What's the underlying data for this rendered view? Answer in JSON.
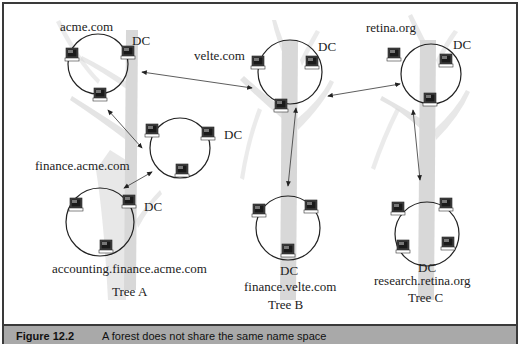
{
  "figure": {
    "caption_number": "Figure 12.2",
    "caption_text": "A forest does not share the same name space"
  },
  "colors": {
    "tree_trunk": "#d4d4d4",
    "frame_border": "#3a3a3a",
    "caption_band": "#a9a9a9",
    "circle_stroke": "#222222",
    "arrow": "#333333"
  },
  "trees": [
    {
      "id": "A",
      "label": "Tree A"
    },
    {
      "id": "B",
      "label": "Tree B"
    },
    {
      "id": "C",
      "label": "Tree C"
    }
  ],
  "domains": [
    {
      "name": "acme.com",
      "dc_label": "DC",
      "tree": "A",
      "computers": 3
    },
    {
      "name": "finance.acme.com",
      "dc_label": "DC",
      "tree": "A",
      "computers": 3
    },
    {
      "name": "accounting.finance.acme.com",
      "dc_label": "DC",
      "tree": "A",
      "computers": 3
    },
    {
      "name": "velte.com",
      "dc_label": "DC",
      "tree": "B",
      "computers": 3
    },
    {
      "name": "finance.velte.com",
      "dc_label": "DC",
      "tree": "B",
      "computers": 3
    },
    {
      "name": "retina.org",
      "dc_label": "DC",
      "tree": "C",
      "computers": 3
    },
    {
      "name": "research.retina.org",
      "dc_label": "DC",
      "tree": "C",
      "computers": 4
    }
  ],
  "trusts": [
    {
      "from": "acme.com",
      "to": "velte.com",
      "type": "two-way"
    },
    {
      "from": "velte.com",
      "to": "retina.org",
      "type": "two-way"
    },
    {
      "from": "acme.com",
      "to": "finance.acme.com",
      "type": "two-way"
    },
    {
      "from": "finance.acme.com",
      "to": "accounting.finance.acme.com",
      "type": "two-way"
    },
    {
      "from": "velte.com",
      "to": "finance.velte.com",
      "type": "two-way"
    },
    {
      "from": "retina.org",
      "to": "research.retina.org",
      "type": "two-way"
    }
  ]
}
